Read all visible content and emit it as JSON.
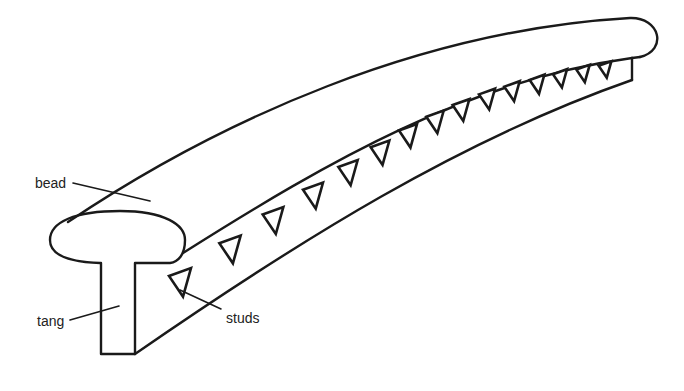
{
  "diagram": {
    "type": "technical line drawing",
    "line_color": "#1a1a1a",
    "background": "#ffffff",
    "labels": {
      "bead": "bead",
      "tang": "tang",
      "studs": "studs"
    },
    "stud_count": 17,
    "studs": [
      {
        "x": 180,
        "y": 285,
        "s": 1.0
      },
      {
        "x": 230,
        "y": 252,
        "s": 0.97
      },
      {
        "x": 273,
        "y": 223,
        "s": 0.94
      },
      {
        "x": 313,
        "y": 198,
        "s": 0.91
      },
      {
        "x": 348,
        "y": 175,
        "s": 0.88
      },
      {
        "x": 380,
        "y": 155,
        "s": 0.85
      },
      {
        "x": 408,
        "y": 138,
        "s": 0.82
      },
      {
        "x": 435,
        "y": 124,
        "s": 0.79
      },
      {
        "x": 461,
        "y": 112,
        "s": 0.76
      },
      {
        "x": 487,
        "y": 101,
        "s": 0.73
      },
      {
        "x": 512,
        "y": 93,
        "s": 0.7
      },
      {
        "x": 537,
        "y": 86,
        "s": 0.67
      },
      {
        "x": 560,
        "y": 80,
        "s": 0.64
      },
      {
        "x": 583,
        "y": 75,
        "s": 0.61
      },
      {
        "x": 605,
        "y": 71,
        "s": 0.58
      }
    ]
  }
}
